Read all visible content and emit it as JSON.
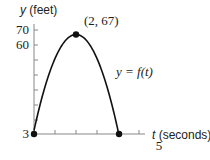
{
  "chart_data": {
    "type": "line",
    "title": "",
    "xlabel_var": "t",
    "xlabel_unit": "(seconds)",
    "ylabel_var": "y",
    "ylabel_unit": "(feet)",
    "curve_label": "y = f(t)",
    "xlim": [
      0,
      5
    ],
    "ylim": [
      3,
      70
    ],
    "x_ticks": [
      1,
      2,
      3,
      4,
      5
    ],
    "x_tick_labels": [
      {
        "value": 5,
        "label": "5"
      }
    ],
    "y_ticks": [
      10,
      20,
      30,
      40,
      50,
      60,
      70
    ],
    "y_tick_labels": [
      {
        "value": 70,
        "label": "70"
      },
      {
        "value": 60,
        "label": "60"
      },
      {
        "value": 3,
        "label": "3"
      }
    ],
    "function": {
      "form": "parabola",
      "vertex": [
        2,
        67
      ],
      "through": [
        0,
        3
      ]
    },
    "points": [
      {
        "x": 0,
        "y": 3,
        "label": ""
      },
      {
        "x": 2,
        "y": 67,
        "label": "(2, 67)"
      },
      {
        "x": 4.05,
        "y": 0,
        "label": ""
      }
    ]
  }
}
